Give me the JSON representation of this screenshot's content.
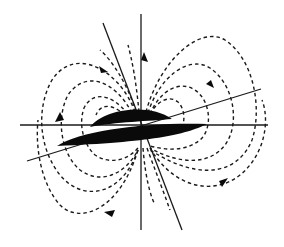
{
  "diagram": {
    "title": "",
    "colors": {
      "background": "#ffffff",
      "ink": "#0a0a0a"
    },
    "elements": {
      "bodies": [
        "upper-lens",
        "lower-lens"
      ],
      "axes": [
        "vertical-axis",
        "tilted-axis-steep",
        "horizontal-axis",
        "tilted-axis-shallow"
      ],
      "field_lines": "dashed closed loops, arrows indicating direction",
      "arrow_count": 6
    }
  }
}
